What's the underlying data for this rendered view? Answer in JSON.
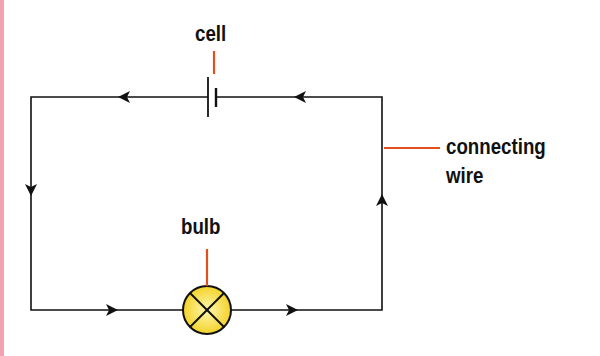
{
  "diagram": {
    "labels": {
      "cell": "cell",
      "bulb": "bulb",
      "wire_line1": "connecting",
      "wire_line2": "wire"
    },
    "colors": {
      "wire": "#111111",
      "leader_line": "#e2501e",
      "bulb_fill": "#f5d821",
      "edge_bar": "#f2a2b0"
    },
    "current_direction": "clockwise-arrows: top wire leftward, left wire downward, bottom wire rightward, right wire upward"
  }
}
